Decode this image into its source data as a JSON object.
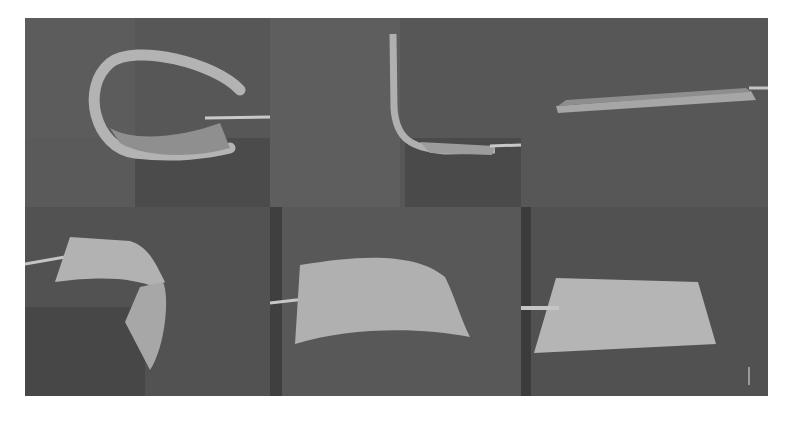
{
  "figure": {
    "layout": {
      "rows": 2,
      "columns": 3
    },
    "panels": [
      {
        "position": "top-left",
        "state": "tightly curled loop"
      },
      {
        "position": "top-middle",
        "state": "bent L-shape, vertical strip"
      },
      {
        "position": "top-right",
        "state": "flat, edge-on view"
      },
      {
        "position": "bottom-left",
        "state": "folded / twisted sheet"
      },
      {
        "position": "bottom-middle",
        "state": "gently curved sheet"
      },
      {
        "position": "bottom-right",
        "state": "flat sheet"
      }
    ],
    "colors": {
      "background": "#ffffff",
      "panel_dark": "#4a4a4a",
      "panel_mid": "#5e5e5e",
      "sheet": "#a9a9a9",
      "rod": "#c8c8c8"
    }
  }
}
